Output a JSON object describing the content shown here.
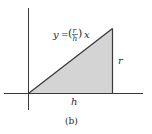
{
  "figure": {
    "caption": "(b)",
    "equation": {
      "lhs": "y",
      "equals": "=",
      "frac_num": "r",
      "frac_den": "h",
      "var": "x"
    },
    "side_labels": {
      "height": "r",
      "base": "h"
    },
    "colors": {
      "fill": "#d4d4d4",
      "stroke": "#3a3a3a",
      "axis": "#3a3a3a"
    }
  }
}
